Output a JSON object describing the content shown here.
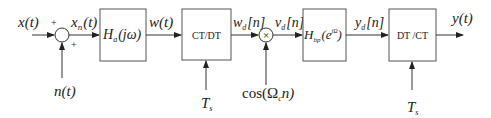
{
  "diagram": {
    "type": "signal-processing-block-diagram",
    "inputs": {
      "x": "x(t)",
      "noise": "n(t)",
      "sum_plus_top": "+",
      "sum_plus_bottom": "+"
    },
    "signals": {
      "xn": {
        "base": "x",
        "sub": "n",
        "arg": "(t)"
      },
      "w": "w(t)",
      "wd": {
        "base": "w",
        "sub": "d",
        "arg": "[n]"
      },
      "vd": {
        "base": "v",
        "sub": "d",
        "arg": "[n]"
      },
      "yd": {
        "base": "y",
        "sub": "d",
        "arg": "[n]"
      },
      "y": "y(t)"
    },
    "blocks": [
      {
        "id": "analog-filter",
        "base": "H",
        "sub": "a",
        "arg": "(jω)"
      },
      {
        "id": "ct-dt",
        "label": "CT/DT",
        "control": {
          "base": "T",
          "sub": "s"
        }
      },
      {
        "id": "bandpass-filter",
        "base": "H",
        "sub": "bp",
        "arg_open": "(e",
        "sup": "jΩ",
        "arg_close": ")"
      },
      {
        "id": "dt-ct",
        "label": "DT /CT",
        "control": {
          "base": "T",
          "sub": "s"
        }
      }
    ],
    "multiplier": {
      "symbol": "×",
      "input": {
        "prefix": "cos(Ω",
        "sub": "c",
        "suffix": "n)"
      }
    }
  }
}
